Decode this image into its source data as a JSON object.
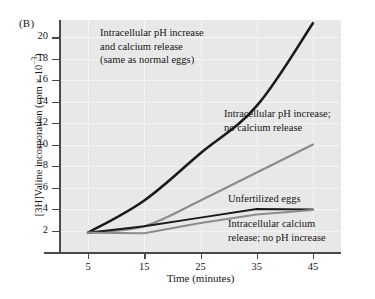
{
  "panel": {
    "label": "(B)"
  },
  "axes": {
    "xlabel": "Time (minutes)",
    "ylabel_text": "[3H]Valine incorporation (cpm × 10",
    "ylabel_exp": "−3",
    "ylabel_tail": ")",
    "xticks": [
      "5",
      "15",
      "25",
      "35",
      "45"
    ],
    "yticks": [
      "2",
      "4",
      "6",
      "8",
      "10",
      "12",
      "14",
      "16",
      "18",
      "20"
    ]
  },
  "annotations": {
    "ph_and_calcium": "Intracellular pH increase\nand calcium release\n(same as normal eggs)",
    "ph_only": "Intracellular pH increase;\nno calcium release",
    "unfertilized": "Unfertilized eggs",
    "calcium_only": "Intracellular calcium\nrelease; no pH increase"
  },
  "colors": {
    "series_dark": "#1a1a1a",
    "series_gray": "#8c8c8c",
    "plot_background": "#e8e8e8",
    "gridline": "#f4f4f4",
    "axis": "#4a4a4a",
    "text": "#161616"
  },
  "chart_data": {
    "type": "line",
    "title": "",
    "xlabel": "Time (minutes)",
    "ylabel": "[3H]Valine incorporation (cpm × 10⁻³)",
    "xlim": [
      0,
      50
    ],
    "ylim": [
      0,
      21.6
    ],
    "xticks": [
      5,
      15,
      25,
      35,
      45
    ],
    "yticks": [
      2,
      4,
      6,
      8,
      10,
      12,
      14,
      16,
      18,
      20
    ],
    "grid": true,
    "legend": "inline-annotations",
    "x": [
      5,
      15,
      25,
      35,
      45
    ],
    "series": [
      {
        "name": "Intracellular pH increase and calcium release (same as normal eggs)",
        "color": "#1a1a1a",
        "width": 2.6,
        "values": [
          1.8,
          4.8,
          9.2,
          13.6,
          21.3
        ]
      },
      {
        "name": "Intracellular pH increase; no calcium release",
        "color": "#8c8c8c",
        "width": 2.2,
        "values": [
          1.8,
          2.4,
          4.8,
          7.4,
          10.0
        ]
      },
      {
        "name": "Unfertilized eggs",
        "color": "#1a1a1a",
        "width": 2.0,
        "values": [
          1.8,
          2.4,
          3.2,
          4.0,
          3.95
        ]
      },
      {
        "name": "Intracellular calcium release; no pH increase",
        "color": "#8c8c8c",
        "width": 2.0,
        "values": [
          1.8,
          1.75,
          2.7,
          3.5,
          3.9
        ]
      }
    ]
  }
}
